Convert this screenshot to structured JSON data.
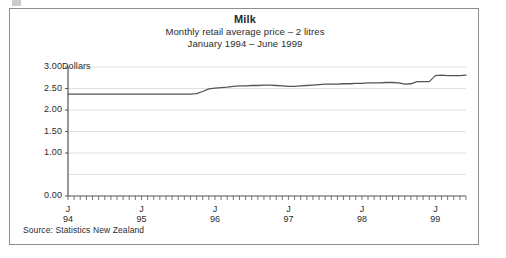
{
  "figure": {
    "title": "Milk",
    "subtitle_1": "Monthly retail average price – 2 litres",
    "subtitle_2": "January 1994 – June 1999",
    "axis_unit_label": "Dollars",
    "source_note": "Source: Statistics New Zealand",
    "line_color": "#555555",
    "frame_color": "#8e8e8e",
    "grid_color": "#d8d8d8"
  },
  "chart_data": {
    "type": "line",
    "title": "Milk",
    "subtitle": "Monthly retail average price – 2 litres",
    "period": "January 1994 – June 1999",
    "xlabel": "",
    "ylabel": "Dollars",
    "ylim": [
      0.0,
      3.0
    ],
    "ytick_labels": [
      "3.00",
      "2.50",
      "2.00",
      "1.50",
      "1.00",
      "0.00"
    ],
    "ytick_values": [
      3.0,
      2.5,
      2.0,
      1.5,
      1.0,
      0.0
    ],
    "unlabelled_gridlines": [
      0.5
    ],
    "grid": true,
    "legend": "none",
    "xtick_labels": [
      "J",
      "J",
      "J",
      "J",
      "J",
      "J"
    ],
    "xtick_years": [
      "94",
      "95",
      "96",
      "97",
      "98",
      "99"
    ],
    "xtick_x": [
      "1994-01",
      "1995-01",
      "1996-01",
      "1997-01",
      "1998-01",
      "1999-01"
    ],
    "x_minor_ticks": "monthly",
    "series": [
      {
        "name": "Milk, 2 litres, monthly retail average price",
        "unit": "NZD",
        "x": [
          "1994-01",
          "1994-02",
          "1994-03",
          "1994-04",
          "1994-05",
          "1994-06",
          "1994-07",
          "1994-08",
          "1994-09",
          "1994-10",
          "1994-11",
          "1994-12",
          "1995-01",
          "1995-02",
          "1995-03",
          "1995-04",
          "1995-05",
          "1995-06",
          "1995-07",
          "1995-08",
          "1995-09",
          "1995-10",
          "1995-11",
          "1995-12",
          "1996-01",
          "1996-02",
          "1996-03",
          "1996-04",
          "1996-05",
          "1996-06",
          "1996-07",
          "1996-08",
          "1996-09",
          "1996-10",
          "1996-11",
          "1996-12",
          "1997-01",
          "1997-02",
          "1997-03",
          "1997-04",
          "1997-05",
          "1997-06",
          "1997-07",
          "1997-08",
          "1997-09",
          "1997-10",
          "1997-11",
          "1997-12",
          "1998-01",
          "1998-02",
          "1998-03",
          "1998-04",
          "1998-05",
          "1998-06",
          "1998-07",
          "1998-08",
          "1998-09",
          "1998-10",
          "1998-11",
          "1998-12",
          "1999-01",
          "1999-02",
          "1999-03",
          "1999-04",
          "1999-05",
          "1999-06"
        ],
        "values": [
          2.37,
          2.37,
          2.37,
          2.37,
          2.37,
          2.37,
          2.37,
          2.37,
          2.37,
          2.37,
          2.37,
          2.37,
          2.37,
          2.37,
          2.37,
          2.37,
          2.37,
          2.37,
          2.37,
          2.37,
          2.37,
          2.38,
          2.43,
          2.49,
          2.51,
          2.52,
          2.53,
          2.55,
          2.56,
          2.56,
          2.57,
          2.57,
          2.58,
          2.58,
          2.57,
          2.56,
          2.55,
          2.55,
          2.56,
          2.57,
          2.58,
          2.59,
          2.6,
          2.6,
          2.6,
          2.61,
          2.61,
          2.62,
          2.62,
          2.63,
          2.63,
          2.63,
          2.64,
          2.64,
          2.63,
          2.6,
          2.61,
          2.66,
          2.66,
          2.66,
          2.8,
          2.81,
          2.8,
          2.8,
          2.8,
          2.81
        ]
      }
    ]
  }
}
